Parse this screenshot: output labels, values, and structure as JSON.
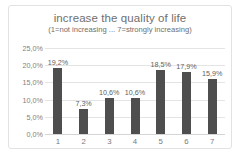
{
  "chart_data": {
    "type": "bar",
    "title": "increase the quality of life",
    "subtitle": "(1=not increasing ... 7=strongly increasing)",
    "xlabel": "",
    "ylabel": "",
    "categories": [
      "1",
      "2",
      "3",
      "4",
      "5",
      "6",
      "7"
    ],
    "values": [
      19.2,
      7.3,
      10.6,
      10.6,
      18.5,
      17.9,
      15.9
    ],
    "data_labels": [
      "19,2%",
      "7,3%",
      "10,6%",
      "10,6%",
      "18,5%",
      "17,9%",
      "15,9%"
    ],
    "ylim": [
      0,
      25
    ],
    "ytick_values": [
      25,
      20,
      15,
      10,
      5,
      0
    ],
    "ytick_labels": [
      "25,0%",
      "20,0%",
      "15,0%",
      "10,0%",
      "5,0%",
      "0,0%"
    ],
    "grid": true,
    "legend": false,
    "bar_color": "#4e4e4e",
    "gridline_color": "#e4e4e4",
    "text_color": "#6f6f6f",
    "background_color": "#ffffff",
    "border_color": "#e2e2e2"
  }
}
